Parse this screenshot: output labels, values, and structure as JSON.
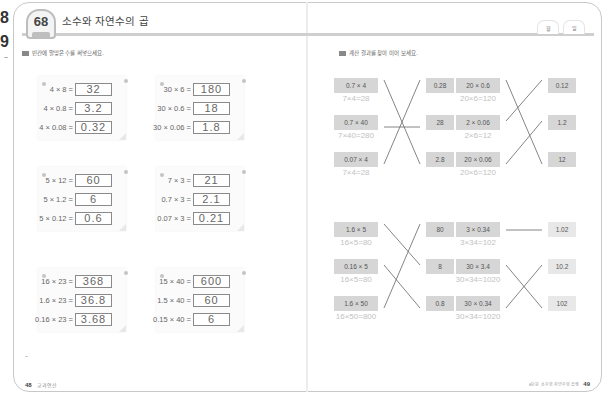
{
  "edge": {
    "digit1": "8",
    "digit2": "9",
    "mark": "~"
  },
  "lesson": {
    "number": "68",
    "title": "소수와 자연수의 곱",
    "date_tabs": [
      "월",
      "일"
    ]
  },
  "left_page": {
    "instruction": "빈칸에 알맞은 수를 써넣으세요.",
    "cards": [
      {
        "rows": [
          {
            "expr": "4 × 8 =",
            "answer": "32"
          },
          {
            "expr": "4 × 0.8 =",
            "answer": "3.2"
          },
          {
            "expr": "4 × 0.08 =",
            "answer": "0.32"
          }
        ]
      },
      {
        "rows": [
          {
            "expr": "30 × 6 =",
            "answer": "180"
          },
          {
            "expr": "30 × 0.6 =",
            "answer": "18"
          },
          {
            "expr": "30 × 0.06 =",
            "answer": "1.8"
          }
        ]
      },
      {
        "rows": [
          {
            "expr": "5 × 12 =",
            "answer": "60"
          },
          {
            "expr": "5 × 1.2 =",
            "answer": "6"
          },
          {
            "expr": "5 × 0.12 =",
            "answer": "0.6"
          }
        ]
      },
      {
        "rows": [
          {
            "expr": "7 × 3 =",
            "answer": "21"
          },
          {
            "expr": "0.7 × 3 =",
            "answer": "2.1"
          },
          {
            "expr": "0.07 × 3 =",
            "answer": "0.21"
          }
        ]
      },
      {
        "rows": [
          {
            "expr": "16 × 23 =",
            "answer": "368"
          },
          {
            "expr": "1.6 × 23 =",
            "answer": "36.8"
          },
          {
            "expr": "0.16 × 23 =",
            "answer": "3.68"
          }
        ]
      },
      {
        "rows": [
          {
            "expr": "15 × 40 =",
            "answer": "600"
          },
          {
            "expr": "1.5 × 40 =",
            "answer": "60"
          },
          {
            "expr": "0.15 × 40 =",
            "answer": "6"
          }
        ]
      }
    ],
    "footer": {
      "page": "48",
      "label": "교과연산"
    }
  },
  "right_page": {
    "instruction": "계산 결과를 찾아 이어 보세요.",
    "groups": [
      {
        "left": [
          {
            "expr": "0.7 × 4",
            "hint": "7×4=28"
          },
          {
            "expr": "0.7 × 40",
            "hint": "7×40=280"
          },
          {
            "expr": "0.07 × 4",
            "hint": "7×4=28"
          }
        ],
        "right": [
          "0.28",
          "28",
          "2.8"
        ],
        "matches": [
          2,
          1,
          0
        ]
      },
      {
        "left": [
          {
            "expr": "20 × 0.6",
            "hint": "20×6=120"
          },
          {
            "expr": "2 × 0.06",
            "hint": "2×6=12"
          },
          {
            "expr": "20 × 0.06",
            "hint": "20×6=120"
          }
        ],
        "right": [
          "0.12",
          "1.2",
          "12"
        ],
        "matches": [
          2,
          0,
          1
        ]
      },
      {
        "left": [
          {
            "expr": "1.6 × 5",
            "hint": "16×5=80"
          },
          {
            "expr": "0.16 × 5",
            "hint": "16×5=80"
          },
          {
            "expr": "1.6 × 50",
            "hint": "16×50=800"
          }
        ],
        "right": [
          "80",
          "8",
          "0.8"
        ],
        "matches": [
          1,
          2,
          0
        ]
      },
      {
        "left": [
          {
            "expr": "3 × 0.34",
            "hint": "3×34=102"
          },
          {
            "expr": "30 × 3.4",
            "hint": "30×34=1020"
          },
          {
            "expr": "30 × 0.34",
            "hint": "30×34=1020"
          }
        ],
        "right": [
          "1.02",
          "10.2",
          "102"
        ],
        "matches": [
          0,
          2,
          1
        ]
      }
    ],
    "footer": {
      "page": "49",
      "label": "6단원 소수와 자연수의 곱셈"
    }
  },
  "colors": {
    "border": "#c8c8c8",
    "box": "#d6d6d6",
    "hint": "#c2c2c2",
    "text": "#555555"
  }
}
